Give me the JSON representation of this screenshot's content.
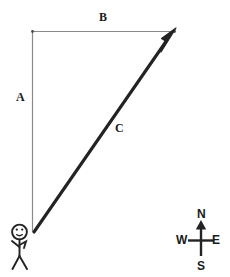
{
  "figure": {
    "type": "vector-diagram",
    "background_color": "#ffffff",
    "ink_color": "#1a1a1a",
    "thin_line_color": "#8a8a8a"
  },
  "labels": {
    "a": "A",
    "b": "B",
    "c": "C"
  },
  "compass": {
    "north": "N",
    "south": "S",
    "east": "E",
    "west": "W"
  },
  "geometry": {
    "vertex_corner": {
      "x": 32,
      "y": 31
    },
    "vertex_origin": {
      "x": 33,
      "y": 232
    },
    "vertex_tip": {
      "x": 175,
      "y": 31
    },
    "leg_a_label": "A",
    "leg_b_label": "B",
    "hypotenuse_label": "C",
    "resultant_direction": "northeast"
  },
  "figures": {
    "observer": "stick-figure",
    "observer_position": {
      "x": 20,
      "y": 248
    }
  }
}
